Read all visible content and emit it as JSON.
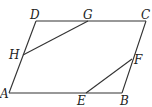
{
  "diagram": {
    "type": "geometry-parallelogram",
    "points": {
      "A": {
        "x": 9,
        "y": 93
      },
      "B": {
        "x": 122,
        "y": 93
      },
      "C": {
        "x": 146,
        "y": 21
      },
      "D": {
        "x": 36,
        "y": 21
      },
      "E": {
        "x": 86,
        "y": 93
      },
      "F": {
        "x": 132,
        "y": 59
      },
      "G": {
        "x": 88,
        "y": 21
      },
      "H": {
        "x": 23,
        "y": 55
      }
    },
    "labels": [
      {
        "text": "D",
        "x": 30,
        "y": 19
      },
      {
        "text": "G",
        "x": 83,
        "y": 19
      },
      {
        "text": "C",
        "x": 141,
        "y": 19
      },
      {
        "text": "H",
        "x": 9,
        "y": 59
      },
      {
        "text": "F",
        "x": 134,
        "y": 64
      },
      {
        "text": "A",
        "x": 0,
        "y": 98
      },
      {
        "text": "E",
        "x": 77,
        "y": 105
      },
      {
        "text": "B",
        "x": 120,
        "y": 105
      }
    ],
    "segments": [
      [
        "A",
        "B"
      ],
      [
        "B",
        "C"
      ],
      [
        "C",
        "D"
      ],
      [
        "D",
        "A"
      ],
      [
        "G",
        "H"
      ],
      [
        "E",
        "F"
      ]
    ]
  }
}
